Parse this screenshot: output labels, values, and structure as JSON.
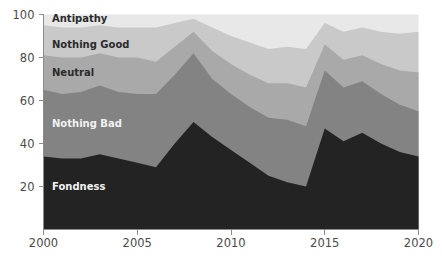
{
  "chart_data": {
    "type": "area",
    "stacked": true,
    "title": "",
    "subtitle": "",
    "xlabel": "",
    "ylabel": "",
    "xlim": [
      2000,
      2020
    ],
    "ylim": [
      0,
      100
    ],
    "grid": false,
    "legend_position": "inline-labels",
    "x": [
      2000,
      2001,
      2002,
      2003,
      2004,
      2005,
      2006,
      2007,
      2008,
      2009,
      2010,
      2011,
      2012,
      2013,
      2014,
      2015,
      2016,
      2017,
      2018,
      2019,
      2020
    ],
    "xticks": [
      2000,
      2005,
      2010,
      2015,
      2020
    ],
    "xtick_labels": [
      "2000",
      "2005",
      "2010",
      "2015",
      "2020"
    ],
    "yticks": [
      20,
      40,
      60,
      80,
      100
    ],
    "ytick_labels": [
      "20",
      "40",
      "60",
      "80",
      "100"
    ],
    "series": [
      {
        "name": "Fondness",
        "color": "#232323",
        "label_color": "#f2f2f2",
        "values": [
          34,
          33,
          33,
          35,
          33,
          31,
          29,
          40,
          50,
          43,
          37,
          31,
          25,
          22,
          20,
          47,
          41,
          45,
          40,
          36,
          34
        ]
      },
      {
        "name": "Nothing Bad",
        "color": "#838383",
        "label_color": "#f2f2f2",
        "values": [
          31,
          30,
          31,
          32,
          31,
          32,
          34,
          32,
          32,
          27,
          26,
          26,
          27,
          29,
          28,
          27,
          25,
          24,
          23,
          22,
          21
        ]
      },
      {
        "name": "Neutral",
        "color": "#a9a9a9",
        "label_color": "#2b2b2b",
        "values": [
          16,
          17,
          16,
          15,
          16,
          17,
          15,
          13,
          10,
          13,
          14,
          15,
          16,
          17,
          18,
          12,
          13,
          12,
          14,
          16,
          18
        ]
      },
      {
        "name": "Nothing Good",
        "color": "#c9c9c9",
        "label_color": "#2b2b2b",
        "values": [
          14,
          14,
          14,
          13,
          14,
          14,
          16,
          11,
          6,
          11,
          13,
          15,
          16,
          17,
          18,
          10,
          13,
          13,
          15,
          17,
          19
        ]
      },
      {
        "name": "Antipathy",
        "color": "#e8e8e8",
        "label_color": "#2b2b2b",
        "values": [
          5,
          6,
          6,
          5,
          6,
          6,
          6,
          4,
          2,
          6,
          10,
          13,
          16,
          15,
          16,
          4,
          8,
          6,
          8,
          9,
          8
        ]
      }
    ],
    "inline_labels": [
      {
        "text": "Antipathy",
        "x": 52,
        "y": 22,
        "color": "dark"
      },
      {
        "text": "Nothing Good",
        "x": 52,
        "y": 48,
        "color": "dark"
      },
      {
        "text": "Neutral",
        "x": 52,
        "y": 76,
        "color": "dark"
      },
      {
        "text": "Nothing Bad",
        "x": 52,
        "y": 127,
        "color": "light"
      },
      {
        "text": "Fondness",
        "x": 52,
        "y": 190,
        "color": "light"
      }
    ],
    "axis_color": "#8c8c8c",
    "background": "#ffffff"
  }
}
